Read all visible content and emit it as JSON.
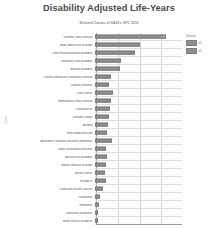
{
  "header": {
    "title": "Disability Adjusted Life-Years",
    "subtitle": "Selected Causes of DALYs, NYC 2015"
  },
  "legend": {
    "title": "Version",
    "items": [
      {
        "label": "all",
        "color": "#8e8e8e"
      },
      {
        "label": "all",
        "color": "#8e8e8e"
      }
    ]
  },
  "chart_data": {
    "type": "bar",
    "orientation": "horizontal",
    "title": "Disability Adjusted Life-Years",
    "subtitle": "Selected Causes of DALYs, NYC 2015",
    "xlabel": "",
    "ylabel": "Cause",
    "grid": true,
    "legend_position": "right",
    "xlim": [
      0,
      100
    ],
    "categories": [
      "Ischemic heart disease",
      "Major depressive disorder",
      "Other musculoskeletal disorders",
      "Substance use disorders",
      "Anxiety disorders",
      "Chronic obstructive pulmonary disease",
      "Diabetes mellitus",
      "Lung cancer",
      "Hypertensive heart disease",
      "Osteoarthritis",
      "Ischemic stroke",
      "Asthma",
      "High blood pressure",
      "Alzheimer's disease and other dementias",
      "Lower respiratory infections",
      "Alcohol use disorders",
      "Bipolar affective disorder",
      "Breast cancer",
      "HIV/AIDS",
      "Colon and rectum cancers",
      "Poisonings",
      "Hormones",
      "Congenital anomalies",
      "Motor vehicle accidents"
    ],
    "values": [
      82,
      52,
      46,
      30,
      29,
      18,
      16,
      21,
      18,
      17,
      16,
      15,
      14,
      20,
      13,
      14,
      13,
      12,
      13,
      9,
      6,
      5,
      4,
      4
    ],
    "value_labels": [
      "82",
      "",
      "",
      "",
      "",
      "",
      "",
      "",
      "",
      "",
      "",
      "",
      "",
      "",
      "",
      "",
      "",
      "",
      "",
      "",
      "",
      "",
      "",
      ""
    ],
    "gridlines": [
      25,
      50,
      75
    ]
  }
}
